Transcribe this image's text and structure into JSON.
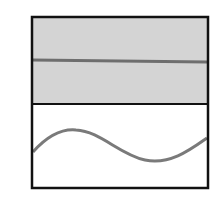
{
  "diagram": {
    "colors": {
      "border": "#111111",
      "top_fill": "#d4d4d4",
      "line": "#6e6e6e",
      "wave": "#7a7a7a",
      "bottom_fill": "#ffffff"
    },
    "panels": [
      {
        "name": "top",
        "content": "straight-line"
      },
      {
        "name": "bottom",
        "content": "sine-wave"
      }
    ]
  }
}
